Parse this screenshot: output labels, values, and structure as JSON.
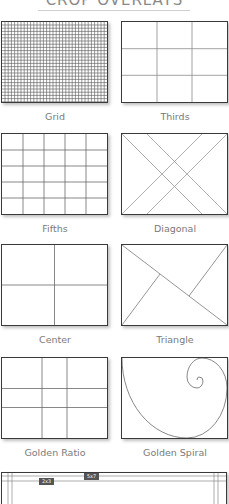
{
  "header": {
    "title": "CROP OVERLAYS"
  },
  "overlays": [
    {
      "id": "grid",
      "label": "Grid"
    },
    {
      "id": "thirds",
      "label": "Thirds"
    },
    {
      "id": "fifths",
      "label": "Fifths"
    },
    {
      "id": "diagonal",
      "label": "Diagonal"
    },
    {
      "id": "center",
      "label": "Center"
    },
    {
      "id": "triangle",
      "label": "Triangle"
    },
    {
      "id": "golden-ratio",
      "label": "Golden Ratio"
    },
    {
      "id": "golden-spiral",
      "label": "Golden Spiral"
    }
  ],
  "aspect_panel": {
    "tags": [
      "2x3",
      "5x7"
    ]
  },
  "colors": {
    "frame": "#3a3a3a",
    "guide": "#9a9a9a",
    "label": "#7a7a7a",
    "tag_bg": "#555555"
  }
}
